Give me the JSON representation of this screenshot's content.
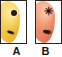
{
  "figure": {
    "name": "two-panel-specimen-comparison",
    "background_color": "#ffffff",
    "panel_border_color": "#2b2320",
    "panels": [
      {
        "label": "A",
        "body_color": "#eec13c",
        "body_highlight_color": "#fbe9a6",
        "body_shadow_color": "#e0a82c",
        "marks": [
          {
            "name": "dark-spot",
            "type": "spot",
            "color": "#241a14"
          },
          {
            "name": "dark-streak",
            "type": "streak",
            "color": "#191110"
          }
        ]
      },
      {
        "label": "B",
        "body_color": "#e8805c",
        "body_highlight_color": "#f7c2ad",
        "body_shadow_color": "#d86a46",
        "marks": [
          {
            "name": "dark-radiating-spot",
            "type": "radiating-spot",
            "color": "#1d1410",
            "glyph": "✳"
          },
          {
            "name": "dark-streak",
            "type": "streak",
            "color": "#191110"
          }
        ]
      }
    ],
    "label_color": "#191414"
  }
}
